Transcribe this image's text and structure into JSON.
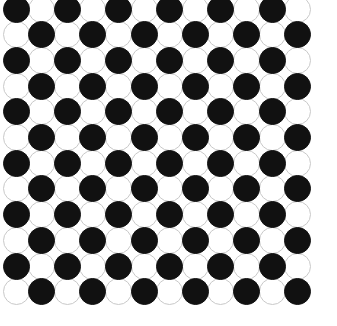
{
  "figure": {
    "type": "circle-grid-pattern",
    "background_color": "#ffffff",
    "width_px": 337,
    "height_px": 326
  },
  "grid": {
    "rows": 12,
    "columns": 12,
    "total_circles": 144,
    "black_count": 72,
    "white_count": 72,
    "origin_x_px": 16,
    "origin_y_px": 9,
    "pitch_x_px": 25.6,
    "pitch_y_px": 25.7,
    "circle_diameter_px": 27,
    "pattern_rule": "checkerboard: black where (row + column) is even, white otherwise",
    "first_cell_color": "black"
  },
  "colors": {
    "black_fill": "#111111",
    "white_fill": "#ffffff",
    "white_outline": "#c9c9c9",
    "black_outline": "#111111"
  },
  "legend": {
    "black_label": "black-circle",
    "white_label": "white-circle"
  },
  "chart_data": {
    "type": "heatmap",
    "xlabel": "",
    "ylabel": "",
    "categories_x": [
      "1",
      "2",
      "3",
      "4",
      "5",
      "6",
      "7",
      "8",
      "9",
      "10",
      "11",
      "12"
    ],
    "categories_y": [
      "1",
      "2",
      "3",
      "4",
      "5",
      "6",
      "7",
      "8",
      "9",
      "10",
      "11",
      "12"
    ],
    "value_legend": {
      "1": "black",
      "0": "white"
    },
    "values": [
      [
        1,
        0,
        1,
        0,
        1,
        0,
        1,
        0,
        1,
        0,
        1,
        0
      ],
      [
        0,
        1,
        0,
        1,
        0,
        1,
        0,
        1,
        0,
        1,
        0,
        1
      ],
      [
        1,
        0,
        1,
        0,
        1,
        0,
        1,
        0,
        1,
        0,
        1,
        0
      ],
      [
        0,
        1,
        0,
        1,
        0,
        1,
        0,
        1,
        0,
        1,
        0,
        1
      ],
      [
        1,
        0,
        1,
        0,
        1,
        0,
        1,
        0,
        1,
        0,
        1,
        0
      ],
      [
        0,
        1,
        0,
        1,
        0,
        1,
        0,
        1,
        0,
        1,
        0,
        1
      ],
      [
        1,
        0,
        1,
        0,
        1,
        0,
        1,
        0,
        1,
        0,
        1,
        0
      ],
      [
        0,
        1,
        0,
        1,
        0,
        1,
        0,
        1,
        0,
        1,
        0,
        1
      ],
      [
        1,
        0,
        1,
        0,
        1,
        0,
        1,
        0,
        1,
        0,
        1,
        0
      ],
      [
        0,
        1,
        0,
        1,
        0,
        1,
        0,
        1,
        0,
        1,
        0,
        1
      ],
      [
        1,
        0,
        1,
        0,
        1,
        0,
        1,
        0,
        1,
        0,
        1,
        0
      ],
      [
        0,
        1,
        0,
        1,
        0,
        1,
        0,
        1,
        0,
        1,
        0,
        1
      ]
    ],
    "grid": false,
    "legend_position": "none"
  }
}
